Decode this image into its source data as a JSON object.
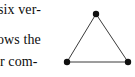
{
  "page": {
    "background_color": "#ffffff",
    "text_color": "#0d0d0d",
    "width": 135,
    "height": 77
  },
  "text_column": {
    "lines": [
      {
        "id": "line-1",
        "text": "six ver-"
      },
      {
        "id": "line-2",
        "text": "ows the"
      },
      {
        "id": "line-3",
        "text": "r com-"
      }
    ]
  },
  "figure": {
    "name": "triangle-graph",
    "edge_color": "#3a3a3a",
    "vertex_color": "#101010",
    "vertex_radius": 3.2,
    "edge_width": 1,
    "vertices": [
      {
        "id": "top",
        "x": 40,
        "y": 14
      },
      {
        "id": "bottom-left",
        "x": 11,
        "y": 62
      },
      {
        "id": "bottom-right",
        "x": 72,
        "y": 62
      }
    ],
    "edges": [
      {
        "from": "top",
        "to": "bottom-left"
      },
      {
        "from": "top",
        "to": "bottom-right"
      },
      {
        "from": "bottom-left",
        "to": "bottom-right"
      }
    ]
  }
}
